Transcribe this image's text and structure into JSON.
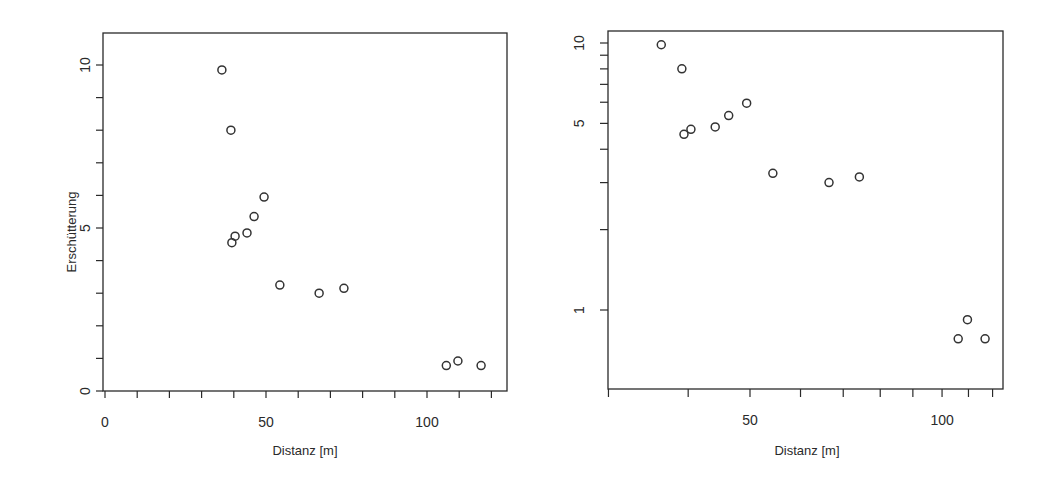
{
  "figure": {
    "panels": 2
  },
  "chart_data": [
    {
      "type": "scatter",
      "title": "",
      "xlabel": "Distanz [m]",
      "ylabel": "Erschütterung",
      "xscale": "linear",
      "yscale": "linear",
      "xlim": [
        0,
        125
      ],
      "ylim": [
        0,
        11
      ],
      "x_ticks": [
        0,
        10,
        20,
        30,
        40,
        50,
        60,
        70,
        80,
        90,
        100,
        110,
        120
      ],
      "x_tick_labels": [
        "0",
        "50",
        "100"
      ],
      "x_labeled_ticks": [
        0,
        50,
        100
      ],
      "y_ticks": [
        0,
        1,
        2,
        3,
        4,
        5,
        6,
        7,
        8,
        9,
        10
      ],
      "y_tick_labels": [
        "0",
        "5",
        "10"
      ],
      "y_labeled_ticks": [
        0,
        5,
        10
      ],
      "grid": false,
      "legend": null,
      "marker": "open-circle",
      "x": [
        36.3,
        39.1,
        49.4,
        46.3,
        44.1,
        40.4,
        39.4,
        54.3,
        66.5,
        74.2,
        106.0,
        109.6,
        116.8
      ],
      "y": [
        9.85,
        8.0,
        5.95,
        5.35,
        4.85,
        4.75,
        4.55,
        3.25,
        3.0,
        3.15,
        0.78,
        0.92,
        0.78
      ]
    },
    {
      "type": "scatter",
      "title": "",
      "xlabel": "Distanz [m]",
      "ylabel": "",
      "xscale": "log",
      "yscale": "log",
      "xlim": [
        30,
        125
      ],
      "ylim": [
        0.5,
        11
      ],
      "x_ticks": [
        30,
        40,
        50,
        60,
        70,
        80,
        90,
        100,
        110,
        120
      ],
      "x_tick_labels": [
        "50",
        "100"
      ],
      "x_labeled_ticks": [
        50,
        100
      ],
      "y_ticks": [
        1,
        2,
        3,
        4,
        5,
        6,
        7,
        8,
        9,
        10
      ],
      "y_tick_labels": [
        "1",
        "5",
        "10"
      ],
      "y_labeled_ticks": [
        1,
        5,
        10
      ],
      "grid": false,
      "legend": null,
      "marker": "open-circle",
      "x": [
        36.3,
        39.1,
        49.4,
        46.3,
        44.1,
        40.4,
        39.4,
        54.3,
        66.5,
        74.2,
        106.0,
        109.6,
        116.8
      ],
      "y": [
        9.85,
        8.0,
        5.95,
        5.35,
        4.85,
        4.75,
        4.55,
        3.25,
        3.0,
        3.15,
        0.78,
        0.92,
        0.78
      ]
    }
  ]
}
